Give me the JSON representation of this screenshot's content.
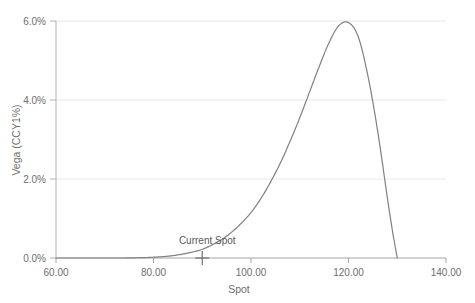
{
  "chart_data": {
    "type": "line",
    "title": "",
    "xlabel": "Spot",
    "ylabel": "Vega (CCY1%)",
    "xlim": [
      60,
      140
    ],
    "ylim": [
      0,
      6
    ],
    "grid": true,
    "legend": "none",
    "x_tick_labels": [
      "60.00",
      "80.00",
      "100.00",
      "120.00",
      "140.00"
    ],
    "x_ticks": [
      60,
      80,
      100,
      120,
      140
    ],
    "y_tick_labels": [
      "0.0%",
      "2.0%",
      "4.0%",
      "6.0%"
    ],
    "y_ticks": [
      0,
      2,
      4,
      6
    ],
    "series": [
      {
        "name": "Vega",
        "color": "#808080",
        "x": [
          60,
          62,
          64,
          66,
          68,
          70,
          72,
          74,
          76,
          78,
          80,
          82,
          84,
          86,
          88,
          90,
          92,
          94,
          96,
          98,
          100,
          102,
          104,
          106,
          108,
          110,
          112,
          114,
          116,
          118,
          120,
          122,
          124,
          126,
          128,
          129,
          130
        ],
        "values": [
          0.0,
          0.0,
          0.0,
          0.0,
          0.0,
          0.0,
          0.0,
          0.0,
          0.005,
          0.01,
          0.02,
          0.035,
          0.06,
          0.1,
          0.15,
          0.22,
          0.33,
          0.47,
          0.65,
          0.88,
          1.15,
          1.5,
          1.92,
          2.4,
          2.95,
          3.55,
          4.2,
          4.85,
          5.45,
          5.88,
          5.96,
          5.6,
          4.6,
          3.2,
          1.5,
          0.7,
          0.0
        ]
      }
    ],
    "annotations": [
      {
        "name": "current-spot",
        "label": "Current Spot",
        "x": 90,
        "y": 0,
        "marker": "cross"
      }
    ],
    "axis_color": "#a6a6a6",
    "grid_color": "#e8e8e8",
    "text_color": "#6e6e6e"
  }
}
